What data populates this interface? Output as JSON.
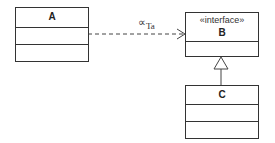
{
  "diagram": {
    "type": "UML class diagram",
    "classes": [
      {
        "id": "A",
        "name": "A",
        "stereotype": null,
        "compartments": 3
      },
      {
        "id": "B",
        "name": "B",
        "stereotype": "«interface»",
        "compartments": 2
      },
      {
        "id": "C",
        "name": "C",
        "stereotype": null,
        "compartments": 3
      }
    ],
    "relations": [
      {
        "from": "A",
        "to": "B",
        "kind": "dependency (dashed, open arrow)",
        "label_symbol": "∝",
        "label_sub": "Ta"
      },
      {
        "from": "C",
        "to": "B",
        "kind": "generalization (solid, hollow triangle)"
      }
    ]
  },
  "labels": {
    "a_name": "A",
    "b_stereo": "«interface»",
    "b_name": "B",
    "c_name": "C",
    "dep_symbol": "∝",
    "dep_sub": "Ta"
  },
  "colors": {
    "stroke": "#333333",
    "background": "#ffffff"
  }
}
